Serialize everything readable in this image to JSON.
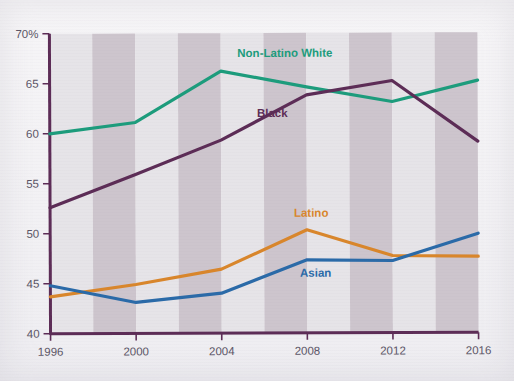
{
  "chart_data": {
    "type": "line",
    "title": "",
    "subtitle": "",
    "xlabel": "",
    "ylabel": "",
    "x": [
      1996,
      2000,
      2004,
      2008,
      2012,
      2016
    ],
    "xtick_labels": [
      "1996",
      "2000",
      "2004",
      "2008",
      "2012",
      "2016"
    ],
    "ytick_labels": [
      "40",
      "45",
      "50",
      "55",
      "60",
      "65",
      "70%"
    ],
    "ytick_values": [
      40,
      45,
      50,
      55,
      60,
      65,
      70
    ],
    "ylim": [
      40,
      70
    ],
    "xlim": [
      1996,
      2016
    ],
    "grid": false,
    "banded_background": true,
    "legend_position": "inline-labels",
    "series": [
      {
        "name": "Non-Latino White",
        "color": "#1c9c7c",
        "values": [
          60.0,
          61.1,
          66.2,
          64.6,
          63.1,
          65.2
        ],
        "label_x": 2007.0,
        "label_y": 67.6
      },
      {
        "name": "Black",
        "color": "#5c2c56",
        "values": [
          52.6,
          55.9,
          59.3,
          63.8,
          65.2,
          59.1
        ],
        "label_x": 2006.4,
        "label_y": 61.6
      },
      {
        "name": "Latino",
        "color": "#d9862b",
        "values": [
          43.7,
          44.9,
          46.4,
          50.3,
          47.7,
          47.6
        ],
        "label_x": 2008.2,
        "label_y": 51.6
      },
      {
        "name": "Asian",
        "color": "#2a6aa8",
        "values": [
          44.8,
          43.1,
          44.0,
          47.3,
          47.2,
          49.9
        ],
        "label_x": 2008.4,
        "label_y": 45.6
      }
    ]
  },
  "axes": {
    "axis_color": "#5c2c56",
    "tick_text_color": "#5b5566"
  },
  "background": {
    "page_color": "#f3f2f5",
    "band_light": "#e6e4e8",
    "band_dark": "#cdc5cd"
  }
}
